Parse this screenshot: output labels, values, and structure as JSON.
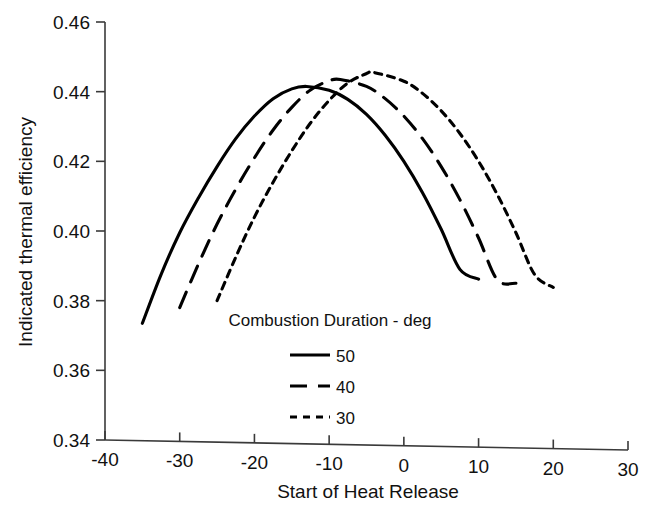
{
  "chart_data": {
    "type": "line",
    "title": "",
    "subtitle": "",
    "xlabel": "Start of Heat Release",
    "ylabel": "Indicated thermal efficiency",
    "xlim": [
      -40,
      30
    ],
    "ylim": [
      0.34,
      0.46
    ],
    "xticks": [
      -40,
      -30,
      -20,
      -10,
      0,
      10,
      20,
      30
    ],
    "yticks": [
      0.34,
      0.36,
      0.38,
      0.4,
      0.42,
      0.44,
      0.46
    ],
    "xtick_labels": [
      "-40",
      "-30",
      "-20",
      "-10",
      "0",
      "10",
      "20",
      "30"
    ],
    "ytick_labels": [
      "0.34",
      "0.36",
      "0.38",
      "0.40",
      "0.42",
      "0.44",
      "0.46"
    ],
    "grid": false,
    "legend_position": "inside-lower-center",
    "legend_title": "Combustion Duration - deg",
    "line_color": "#000000",
    "series": [
      {
        "name": "50",
        "label": "50",
        "dash": "solid",
        "peak_x": -13,
        "peak_y": 0.4415,
        "x": [
          -35,
          -32.5,
          -30,
          -27.5,
          -25,
          -22.5,
          -20,
          -17.5,
          -15,
          -13,
          -10,
          -7.5,
          -5,
          -2.5,
          0,
          2.5,
          5,
          7.5,
          10
        ],
        "y": [
          0.3735,
          0.3875,
          0.3995,
          0.4095,
          0.4185,
          0.4265,
          0.433,
          0.438,
          0.4408,
          0.4415,
          0.4404,
          0.4378,
          0.4335,
          0.4275,
          0.42,
          0.411,
          0.4005,
          0.389,
          0.3862
        ]
      },
      {
        "name": "40",
        "label": "40",
        "dash": "long-dash",
        "peak_x": -8.5,
        "peak_y": 0.4435,
        "x": [
          -30,
          -27.5,
          -25,
          -22.5,
          -20,
          -17.5,
          -15,
          -12.5,
          -10,
          -8.5,
          -5,
          -2.5,
          0,
          2.5,
          5,
          7.5,
          10,
          12.5,
          15
        ],
        "y": [
          0.378,
          0.3905,
          0.402,
          0.412,
          0.421,
          0.429,
          0.4355,
          0.4405,
          0.4431,
          0.4435,
          0.4415,
          0.438,
          0.433,
          0.4265,
          0.4185,
          0.409,
          0.398,
          0.386,
          0.385
        ]
      },
      {
        "name": "30",
        "label": "30",
        "dash": "short-dash",
        "peak_x": -4,
        "peak_y": 0.4455,
        "x": [
          -25,
          -22.5,
          -20,
          -17.5,
          -15,
          -12.5,
          -10,
          -7.5,
          -5,
          -4,
          0,
          2.5,
          5,
          7.5,
          10,
          12.5,
          15,
          17.5,
          20
        ],
        "y": [
          0.38,
          0.3925,
          0.404,
          0.414,
          0.423,
          0.431,
          0.4375,
          0.4425,
          0.4452,
          0.4455,
          0.443,
          0.4395,
          0.4345,
          0.428,
          0.42,
          0.4105,
          0.3995,
          0.3875,
          0.3838
        ]
      }
    ]
  },
  "axes": {
    "x_axis_name": "x-axis",
    "y_axis_name": "y-axis"
  }
}
